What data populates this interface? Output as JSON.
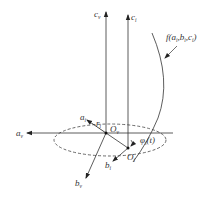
{
  "diagram": {
    "axes": {
      "c_v": {
        "base": "c",
        "sub": "v"
      },
      "c_i": {
        "base": "c",
        "sub": "i"
      },
      "a_v": {
        "base": "a",
        "sub": "v"
      },
      "a_i": {
        "base": "a",
        "sub": "i"
      },
      "b_v": {
        "base": "b",
        "sub": "v"
      },
      "b_i": {
        "base": "b",
        "sub": "i"
      }
    },
    "origins": {
      "O_v": {
        "base": "O",
        "sub": "v"
      },
      "O_i": {
        "base": "O",
        "sub": "i"
      }
    },
    "radius": {
      "base": "r",
      "sub": "i"
    },
    "angle": {
      "base": "φ",
      "sub": "i",
      "arg": "(t)"
    },
    "curve": {
      "label_prefix": "f(a",
      "s1": "i",
      "mid1": ",b",
      "s2": "i",
      "mid2": ",c",
      "s3": "i",
      "suffix": ")"
    },
    "colors": {
      "stroke": "#333333",
      "background": "#ffffff"
    }
  }
}
